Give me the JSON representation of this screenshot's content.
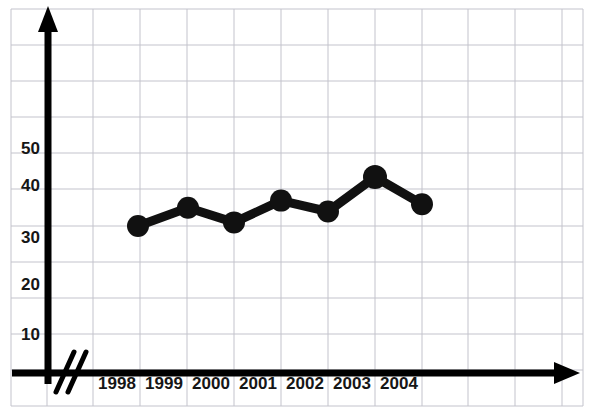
{
  "chart_data": {
    "type": "line",
    "title": "",
    "xlabel": "",
    "ylabel": "",
    "categories": [
      "1998",
      "1999",
      "2000",
      "2001",
      "2002",
      "2003",
      "2004"
    ],
    "values": [
      30,
      35,
      31,
      37,
      34,
      43.5,
      36
    ],
    "series": [
      {
        "name": "",
        "values": [
          30,
          35,
          31,
          37,
          34,
          43.5,
          36
        ]
      }
    ],
    "y_ticks": [
      10,
      20,
      30,
      40,
      50
    ],
    "ytick_labels": [
      "10",
      "20",
      "30",
      "40",
      "50"
    ],
    "ylim": [
      0,
      60
    ],
    "xlim": [
      0,
      12
    ],
    "grid": true,
    "legend": null,
    "axis_break": true,
    "colors": {
      "line": "#111111",
      "marker": "#111111",
      "axis": "#000000",
      "grid": "#b9b9c4",
      "grid_minor": "#d8d8de",
      "background": "#ffffff"
    }
  },
  "axes": {
    "x_axis_name": "x-axis",
    "y_axis_name": "y-axis",
    "break_symbol": "//"
  }
}
